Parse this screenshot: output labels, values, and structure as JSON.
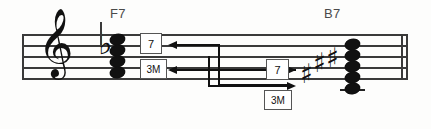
{
  "diagram": {
    "title_chord_left": "F7",
    "title_chord_right": "B7",
    "notation": {
      "clef_glyph": "𝄞",
      "clef_name": "treble-clef",
      "flat_glyph": "♭",
      "sharp_glyph": "♯"
    },
    "interval_boxes": {
      "left_upper_label": "7",
      "left_lower_label": "3M",
      "right_upper_label": "7",
      "right_lower_label": "3M"
    }
  },
  "staff": {
    "line_count": 5,
    "left_barline": true,
    "right_double_barline": true
  },
  "chords": [
    {
      "name": "F7",
      "accidentals": [
        "♭"
      ],
      "notehead_count": 4
    },
    {
      "name": "B7",
      "accidentals": [
        "♯",
        "♯",
        "♯"
      ],
      "notehead_count": 4,
      "ledger_lines": 1
    }
  ],
  "connectors": [
    {
      "name": "seventh-to-third",
      "label": "7",
      "direction": "left"
    },
    {
      "name": "third-to-seventh-bidirectional",
      "label": "3M",
      "direction": "both"
    },
    {
      "name": "third-to-seventh",
      "label": "3M",
      "direction": "right"
    }
  ]
}
